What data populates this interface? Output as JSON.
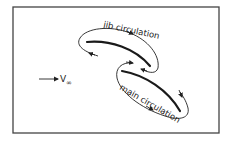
{
  "diagram": {
    "labels": {
      "jib": "jib circulation",
      "main": "main circulation",
      "freestream_v": "V",
      "freestream_sub": "∞"
    },
    "colors": {
      "ink": "#222222",
      "frame": "#444444",
      "background": "#ffffff"
    },
    "elements": [
      {
        "id": "jib-sail",
        "kind": "foil"
      },
      {
        "id": "main-sail",
        "kind": "foil"
      },
      {
        "id": "jib-circulation-loop",
        "kind": "clockwise loop"
      },
      {
        "id": "main-circulation-loop",
        "kind": "clockwise loop"
      },
      {
        "id": "freestream-arrow",
        "kind": "arrow",
        "direction": "right"
      }
    ]
  }
}
